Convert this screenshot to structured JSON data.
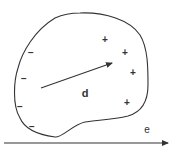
{
  "diagram": {
    "type": "electric-dipole-in-field",
    "colors": {
      "stroke": "#333333",
      "background": "#ffffff"
    },
    "labels": {
      "dipole_vector": "d",
      "field_vector": "e"
    },
    "charges": {
      "positive": [
        "+",
        "+",
        "+",
        "+"
      ],
      "negative": [
        "−",
        "−",
        "−",
        "−"
      ]
    }
  }
}
